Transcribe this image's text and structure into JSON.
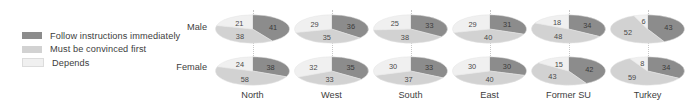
{
  "legend": {
    "items": [
      {
        "label": "Follow instructions immediately",
        "color": "#8c8c8c",
        "key": "follow"
      },
      {
        "label": "Must be convinced first",
        "color": "#d2d2d2",
        "key": "convinced"
      },
      {
        "label": "Depends",
        "color": "#f0f0f0",
        "key": "depends"
      }
    ]
  },
  "rows": [
    {
      "key": "male",
      "label": "Male"
    },
    {
      "key": "female",
      "label": "Female"
    }
  ],
  "chart_data": {
    "type": "pie",
    "title": "",
    "subtitle": "",
    "xlabel": "",
    "ylabel": "",
    "grid": false,
    "legend_position": "left",
    "note": "Grid of ellipse (flattened pie) charts; rows = gender, columns = region; each pie sums to ~100 percent",
    "categories": [
      "North",
      "West",
      "South",
      "East",
      "Former SU",
      "Turkey"
    ],
    "series": [
      {
        "name": "Follow instructions immediately",
        "color": "#8c8c8c"
      },
      {
        "name": "Must be convinced first",
        "color": "#d2d2d2"
      },
      {
        "name": "Depends",
        "color": "#f0f0f0"
      }
    ],
    "cells": [
      {
        "region": "North",
        "gender": "Male",
        "follow": 41,
        "convinced": 38,
        "depends": 21
      },
      {
        "region": "North",
        "gender": "Female",
        "follow": 38,
        "convinced": 58,
        "depends": 24
      },
      {
        "region": "West",
        "gender": "Male",
        "follow": 36,
        "convinced": 35,
        "depends": 29
      },
      {
        "region": "West",
        "gender": "Female",
        "follow": 35,
        "convinced": 33,
        "depends": 32
      },
      {
        "region": "South",
        "gender": "Male",
        "follow": 33,
        "convinced": 38,
        "depends": 25
      },
      {
        "region": "South",
        "gender": "Female",
        "follow": 33,
        "convinced": 37,
        "depends": 30
      },
      {
        "region": "East",
        "gender": "Male",
        "follow": 31,
        "convinced": 40,
        "depends": 29
      },
      {
        "region": "East",
        "gender": "Female",
        "follow": 30,
        "convinced": 40,
        "depends": 30
      },
      {
        "region": "Former SU",
        "gender": "Male",
        "follow": 34,
        "convinced": 48,
        "depends": 18
      },
      {
        "region": "Former SU",
        "gender": "Female",
        "follow": 42,
        "convinced": 43,
        "depends": 15
      },
      {
        "region": "Turkey",
        "gender": "Male",
        "follow": 43,
        "convinced": 52,
        "depends": 6
      },
      {
        "region": "Turkey",
        "gender": "Female",
        "follow": 34,
        "convinced": 59,
        "depends": 8
      }
    ]
  }
}
